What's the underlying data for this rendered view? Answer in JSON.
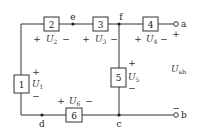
{
  "diagram": {
    "type": "circuit",
    "elements": [
      {
        "id": "1",
        "label": "1",
        "voltage_label": "U",
        "voltage_sub": "1",
        "plus": "+",
        "minus": "−"
      },
      {
        "id": "2",
        "label": "2",
        "voltage_label": "U",
        "voltage_sub": "2",
        "plus": "+",
        "minus": "−"
      },
      {
        "id": "3",
        "label": "3",
        "voltage_label": "U",
        "voltage_sub": "3",
        "plus": "+",
        "minus": "−"
      },
      {
        "id": "4",
        "label": "4",
        "voltage_label": "U",
        "voltage_sub": "4",
        "plus": "+",
        "minus": "−"
      },
      {
        "id": "5",
        "label": "5",
        "voltage_label": "U",
        "voltage_sub": "5",
        "plus": "+",
        "minus": "−"
      },
      {
        "id": "6",
        "label": "6",
        "voltage_label": "U",
        "voltage_sub": "6",
        "plus": "+",
        "minus": "−"
      }
    ],
    "nodes": {
      "c": "c",
      "d": "d",
      "e": "e",
      "f": "f"
    },
    "terminals": {
      "a": "a",
      "b": "b",
      "a_sign": "+",
      "b_sign": "−"
    },
    "output_voltage": {
      "label": "U",
      "sub": "ab"
    }
  }
}
